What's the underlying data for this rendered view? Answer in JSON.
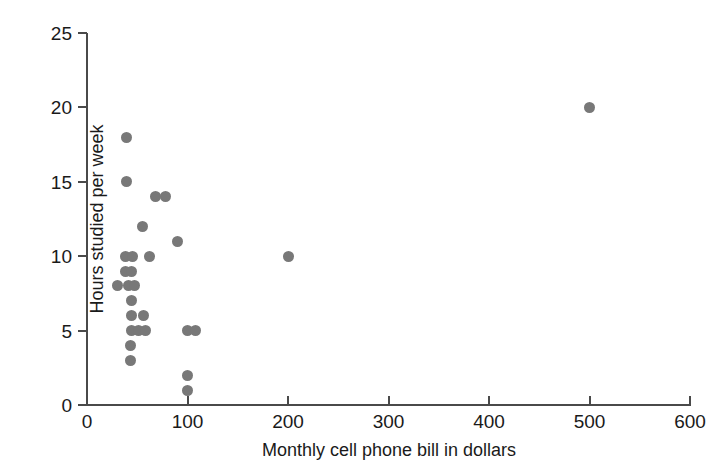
{
  "chart_data": {
    "type": "scatter",
    "title": "",
    "xlabel": "Monthly cell phone bill in dollars",
    "ylabel": "Hours studied per week",
    "xlim": [
      0,
      600
    ],
    "ylim": [
      0,
      25
    ],
    "xticks": [
      0,
      100,
      200,
      300,
      400,
      500,
      600
    ],
    "yticks": [
      0,
      5,
      10,
      15,
      20,
      25
    ],
    "xtick_labels": [
      "0",
      "100",
      "200",
      "300",
      "400",
      "500",
      "600"
    ],
    "ytick_labels": [
      "0",
      "5",
      "10",
      "15",
      "20",
      "25"
    ],
    "grid": false,
    "legend": false,
    "marker": {
      "shape": "circle",
      "color": "#787878",
      "size_px": 11
    },
    "axis_color": "#4a4a4a",
    "background": "#ffffff",
    "n_points": 33,
    "points": [
      {
        "x": 39,
        "y": 18
      },
      {
        "x": 39,
        "y": 15
      },
      {
        "x": 68,
        "y": 14
      },
      {
        "x": 78,
        "y": 14
      },
      {
        "x": 55,
        "y": 12
      },
      {
        "x": 90,
        "y": 11
      },
      {
        "x": 38,
        "y": 10
      },
      {
        "x": 45,
        "y": 10
      },
      {
        "x": 62,
        "y": 10
      },
      {
        "x": 200,
        "y": 10
      },
      {
        "x": 38,
        "y": 9
      },
      {
        "x": 44,
        "y": 9
      },
      {
        "x": 30,
        "y": 8
      },
      {
        "x": 41,
        "y": 8
      },
      {
        "x": 47,
        "y": 8
      },
      {
        "x": 44,
        "y": 7
      },
      {
        "x": 56,
        "y": 6
      },
      {
        "x": 44,
        "y": 6
      },
      {
        "x": 44,
        "y": 5
      },
      {
        "x": 51,
        "y": 5
      },
      {
        "x": 58,
        "y": 5
      },
      {
        "x": 100,
        "y": 5
      },
      {
        "x": 108,
        "y": 5
      },
      {
        "x": 43,
        "y": 4
      },
      {
        "x": 43,
        "y": 3
      },
      {
        "x": 100,
        "y": 2
      },
      {
        "x": 100,
        "y": 1
      },
      {
        "x": 500,
        "y": 20
      }
    ]
  }
}
